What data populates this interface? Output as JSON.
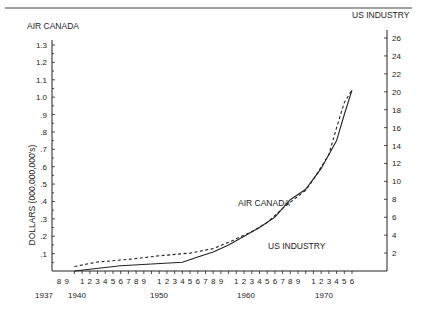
{
  "chart_data": {
    "type": "line",
    "title": "",
    "left_axis": {
      "title": "AIR CANADA",
      "ylabel": "DOLLARS (000,000,000's)",
      "ticks": [
        "1.3",
        "1.2",
        "1.1",
        "1.0",
        ".9",
        ".8",
        ".7",
        ".6",
        ".5",
        ".4",
        ".3",
        ".2",
        ".1"
      ],
      "tick_values": [
        1.3,
        1.2,
        1.1,
        1.0,
        0.9,
        0.8,
        0.7,
        0.6,
        0.5,
        0.4,
        0.3,
        0.2,
        0.1
      ],
      "ylim": [
        0,
        1.3
      ]
    },
    "right_axis": {
      "title": "US INDUSTRY",
      "ticks": [
        "26",
        "24",
        "22",
        "20",
        "18",
        "16",
        "14",
        "12",
        "10",
        "8",
        "6",
        "4",
        "2"
      ],
      "tick_values": [
        26,
        24,
        22,
        20,
        18,
        16,
        14,
        12,
        10,
        8,
        6,
        4,
        2
      ],
      "ylim": [
        0,
        26
      ]
    },
    "x_axis": {
      "tick_labels": [
        "8",
        "9",
        "",
        "1",
        "2",
        "3",
        "4",
        "5",
        "6",
        "7",
        "8",
        "9",
        "",
        "1",
        "2",
        "3",
        "4",
        "5",
        "6",
        "7",
        "8",
        "9",
        "",
        "1",
        "2",
        "3",
        "4",
        "5",
        "6",
        "7",
        "8",
        "9",
        "",
        "1",
        "2",
        "3",
        "4",
        "5",
        "6"
      ],
      "decade_labels": [
        "1937",
        "1940",
        "1950",
        "1960",
        "1970"
      ],
      "xlim": [
        1937,
        1976
      ]
    },
    "series": [
      {
        "name": "AIR CANADA",
        "style": "solid",
        "axis": "left",
        "x": [
          1940,
          1942,
          1946,
          1950,
          1954,
          1956,
          1958,
          1960,
          1962,
          1964,
          1966,
          1968,
          1970,
          1971,
          1972,
          1974,
          1975,
          1976
        ],
        "values": [
          0.0,
          0.01,
          0.03,
          0.04,
          0.05,
          0.08,
          0.11,
          0.15,
          0.2,
          0.25,
          0.31,
          0.41,
          0.47,
          0.53,
          0.59,
          0.75,
          0.9,
          1.04
        ]
      },
      {
        "name": "US INDUSTRY",
        "style": "dashed",
        "axis": "right",
        "x": [
          1940,
          1943,
          1947,
          1951,
          1955,
          1958,
          1960,
          1963,
          1965,
          1967,
          1970,
          1971,
          1973,
          1974,
          1975,
          1976
        ],
        "values": [
          0.5,
          1.0,
          1.3,
          1.7,
          2.0,
          2.5,
          3.2,
          4.4,
          5.4,
          7.0,
          9.0,
          10.2,
          13.0,
          16.0,
          18.8,
          20.2
        ]
      }
    ],
    "annotations": [
      {
        "text": "AIR CANADA",
        "near": "solid line, ~1965"
      },
      {
        "text": "US INDUSTRY",
        "near": "dashed line, ~1963"
      }
    ],
    "grid": false,
    "legend": "inline annotations"
  },
  "labels": {
    "left_title": "AIR CANADA",
    "right_title": "US INDUSTRY",
    "ylabel": "DOLLARS (000,000,000's)",
    "annot_air_canada": "AIR CANADA",
    "annot_us_industry": "US INDUSTRY",
    "y1937": "1937",
    "y1940": "1940",
    "y1950": "1950",
    "y1960": "1960",
    "y1970": "1970"
  }
}
